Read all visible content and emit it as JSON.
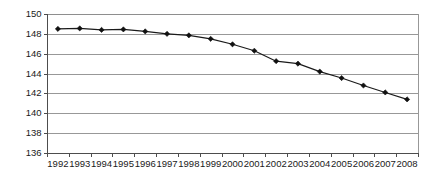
{
  "chart_data": {
    "type": "line",
    "title": "",
    "subtitle": "",
    "xlabel": "",
    "ylabel": "",
    "categories": [
      "1992",
      "1993",
      "1994",
      "1995",
      "1996",
      "1997",
      "1998",
      "1999",
      "2000",
      "2001",
      "2002",
      "2003",
      "2004",
      "2005",
      "2006",
      "2007",
      "2008"
    ],
    "values": [
      148.5,
      148.55,
      148.4,
      148.45,
      148.25,
      148.0,
      147.85,
      147.5,
      146.95,
      146.3,
      145.25,
      145.0,
      144.2,
      143.55,
      142.8,
      142.1,
      141.4
    ],
    "series": [
      {
        "name": "",
        "values": [
          148.5,
          148.55,
          148.4,
          148.45,
          148.25,
          148.0,
          147.85,
          147.5,
          146.95,
          146.3,
          145.25,
          145.0,
          144.2,
          143.55,
          142.8,
          142.1,
          141.4
        ]
      }
    ],
    "ylim": [
      136,
      150
    ],
    "ytick_values": [
      136,
      138,
      140,
      142,
      144,
      146,
      148,
      150
    ],
    "ytick_labels": [
      "136",
      "138",
      "140",
      "142",
      "144",
      "146",
      "148",
      "150"
    ],
    "xtick_labels": [
      "1992",
      "1993",
      "1994",
      "1995",
      "1996",
      "1997",
      "1998",
      "1999",
      "2000",
      "2001",
      "2002",
      "2003",
      "2004",
      "2005",
      "2006",
      "2007",
      "2008"
    ],
    "grid": true,
    "grid_axis": "y",
    "legend": false,
    "legend_position": "none",
    "marker": "diamond",
    "annotations": []
  },
  "style": {
    "line_color": "#1a1a1a",
    "marker_color": "#111111",
    "grid_color": "#8d8d8d",
    "axis_color": "#4d4d4d",
    "border_color": "#6b6b6b",
    "text_color": "#1a1a1a",
    "background": "#ffffff"
  },
  "geometry": {
    "plot_left": 47,
    "plot_right": 418,
    "plot_top": 14,
    "plot_bottom": 153
  }
}
